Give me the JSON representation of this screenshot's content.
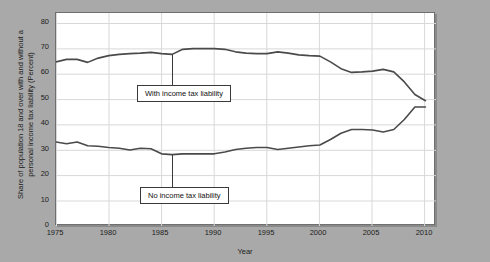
{
  "chart_data": {
    "type": "line",
    "title": "",
    "xlabel": "Year",
    "ylabel": "Share of population 18 and over with and without a personal income tax liability (Percent)",
    "xlim": [
      1975,
      2011
    ],
    "ylim": [
      0,
      85
    ],
    "yticks": [
      0,
      10,
      20,
      30,
      40,
      50,
      60,
      70,
      80
    ],
    "xticks": [
      1975,
      1980,
      1985,
      1990,
      1995,
      2000,
      2005,
      2010
    ],
    "grid": true,
    "legend_position": "inline-annotations",
    "line_color": "#4a4a4a",
    "x": [
      1975,
      1976,
      1977,
      1978,
      1979,
      1980,
      1981,
      1982,
      1983,
      1984,
      1985,
      1986,
      1987,
      1988,
      1989,
      1990,
      1991,
      1992,
      1993,
      1994,
      1995,
      1996,
      1997,
      1998,
      1999,
      2000,
      2001,
      2002,
      2003,
      2004,
      2005,
      2006,
      2007,
      2008,
      2009,
      2010
    ],
    "series": [
      {
        "name": "With income tax liability",
        "values": [
          65.5,
          66.5,
          66.5,
          65.3,
          67.0,
          68.0,
          68.5,
          68.8,
          69.0,
          69.3,
          68.8,
          68.5,
          70.5,
          70.8,
          70.8,
          70.8,
          70.5,
          69.5,
          69.0,
          68.8,
          68.8,
          69.5,
          69.0,
          68.3,
          68.0,
          67.8,
          65.5,
          62.8,
          61.3,
          61.5,
          61.8,
          62.5,
          61.5,
          57.5,
          52.5,
          50.0
        ]
      },
      {
        "name": "No income tax liability",
        "values": [
          33.5,
          32.8,
          33.5,
          32.0,
          31.8,
          31.3,
          31.0,
          30.3,
          31.0,
          30.8,
          28.8,
          28.5,
          28.8,
          28.8,
          28.8,
          28.8,
          29.5,
          30.5,
          31.0,
          31.3,
          31.3,
          30.5,
          31.0,
          31.5,
          32.0,
          32.3,
          34.5,
          37.0,
          38.5,
          38.5,
          38.3,
          37.5,
          38.5,
          42.5,
          47.5,
          47.5
        ]
      }
    ],
    "annotations": [
      {
        "text": "With income tax liability",
        "anchor_year": 1986,
        "anchor_value": 68.5
      },
      {
        "text": "No income tax liability",
        "anchor_year": 1986,
        "anchor_value": 28.5
      }
    ]
  },
  "axis": {
    "y_tick_labels": [
      "80",
      "70",
      "60",
      "50",
      "40",
      "30",
      "20",
      "10",
      "0"
    ],
    "x_tick_labels": [
      "1975",
      "1980",
      "1985",
      "1990",
      "1995",
      "2000",
      "2005",
      "2010"
    ],
    "x_axis_title": "Year",
    "y_axis_title_line1": "Share of population 18 and over with and without a",
    "y_axis_title_line2": "personal income tax liability (Percent)"
  },
  "annotations": {
    "upper_label": "With income tax liability",
    "lower_label": "No income tax liability"
  }
}
